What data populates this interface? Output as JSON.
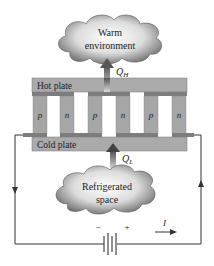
{
  "diagram": {
    "warm_cloud": {
      "line1": "Warm",
      "line2": "environment"
    },
    "cold_cloud": {
      "line1": "Refrigerated",
      "line2": "space"
    },
    "heat_out": {
      "symbol": "Q",
      "subscript": "H"
    },
    "heat_in": {
      "symbol": "Q",
      "subscript": "L"
    },
    "hot_plate_label": "Hot plate",
    "cold_plate_label": "Cold plate",
    "legs": [
      "p",
      "n",
      "p",
      "n",
      "p",
      "n"
    ],
    "battery": {
      "minus": "−",
      "plus": "+"
    },
    "current": {
      "label": "I"
    },
    "colors": {
      "plate": "#a9a9a9",
      "leg": "#a6a6a6",
      "connector": "#7d7d7d",
      "wire": "#333333",
      "cloud_dark": "#6e6e6e",
      "cloud_light": "#f4f4f4"
    }
  }
}
